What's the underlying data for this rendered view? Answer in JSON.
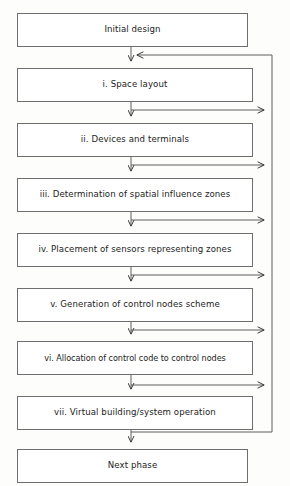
{
  "diagram": {
    "type": "flowchart",
    "orientation": "vertical-top-to-bottom",
    "title": "",
    "nodes": [
      {
        "id": "initial",
        "label": "Initial design",
        "x": 17,
        "y": 13,
        "width": 231,
        "height": 34
      },
      {
        "id": "step1",
        "label": "i. Space layout",
        "x": 17,
        "y": 68,
        "width": 236,
        "height": 34
      },
      {
        "id": "step2",
        "label": "ii. Devices and terminals",
        "x": 17,
        "y": 123,
        "width": 236,
        "height": 34
      },
      {
        "id": "step3",
        "label": "iii. Determination of spatial influence zones",
        "x": 17,
        "y": 178,
        "width": 236,
        "height": 34
      },
      {
        "id": "step4",
        "label": "iv. Placement of sensors representing zones",
        "x": 17,
        "y": 233,
        "width": 236,
        "height": 34
      },
      {
        "id": "step5",
        "label": "v. Generation of control nodes scheme",
        "x": 17,
        "y": 288,
        "width": 236,
        "height": 34
      },
      {
        "id": "step6",
        "label": "vi. Allocation of control code to control nodes",
        "x": 17,
        "y": 341,
        "width": 236,
        "height": 34
      },
      {
        "id": "step7",
        "label": "vii. Virtual building/system operation",
        "x": 17,
        "y": 396,
        "width": 236,
        "height": 34
      },
      {
        "id": "next",
        "label": "Next phase",
        "x": 17,
        "y": 449,
        "width": 231,
        "height": 34
      }
    ],
    "spine_x": 131,
    "return_line_x": 272,
    "return_entry_y": 55,
    "branch_ys": [
      110,
      165,
      220,
      275,
      330,
      385,
      432
    ],
    "stroke_color": "#6e6e6e",
    "arrow_color": "#3a3a3a",
    "background_color": "#fdfdfc"
  }
}
